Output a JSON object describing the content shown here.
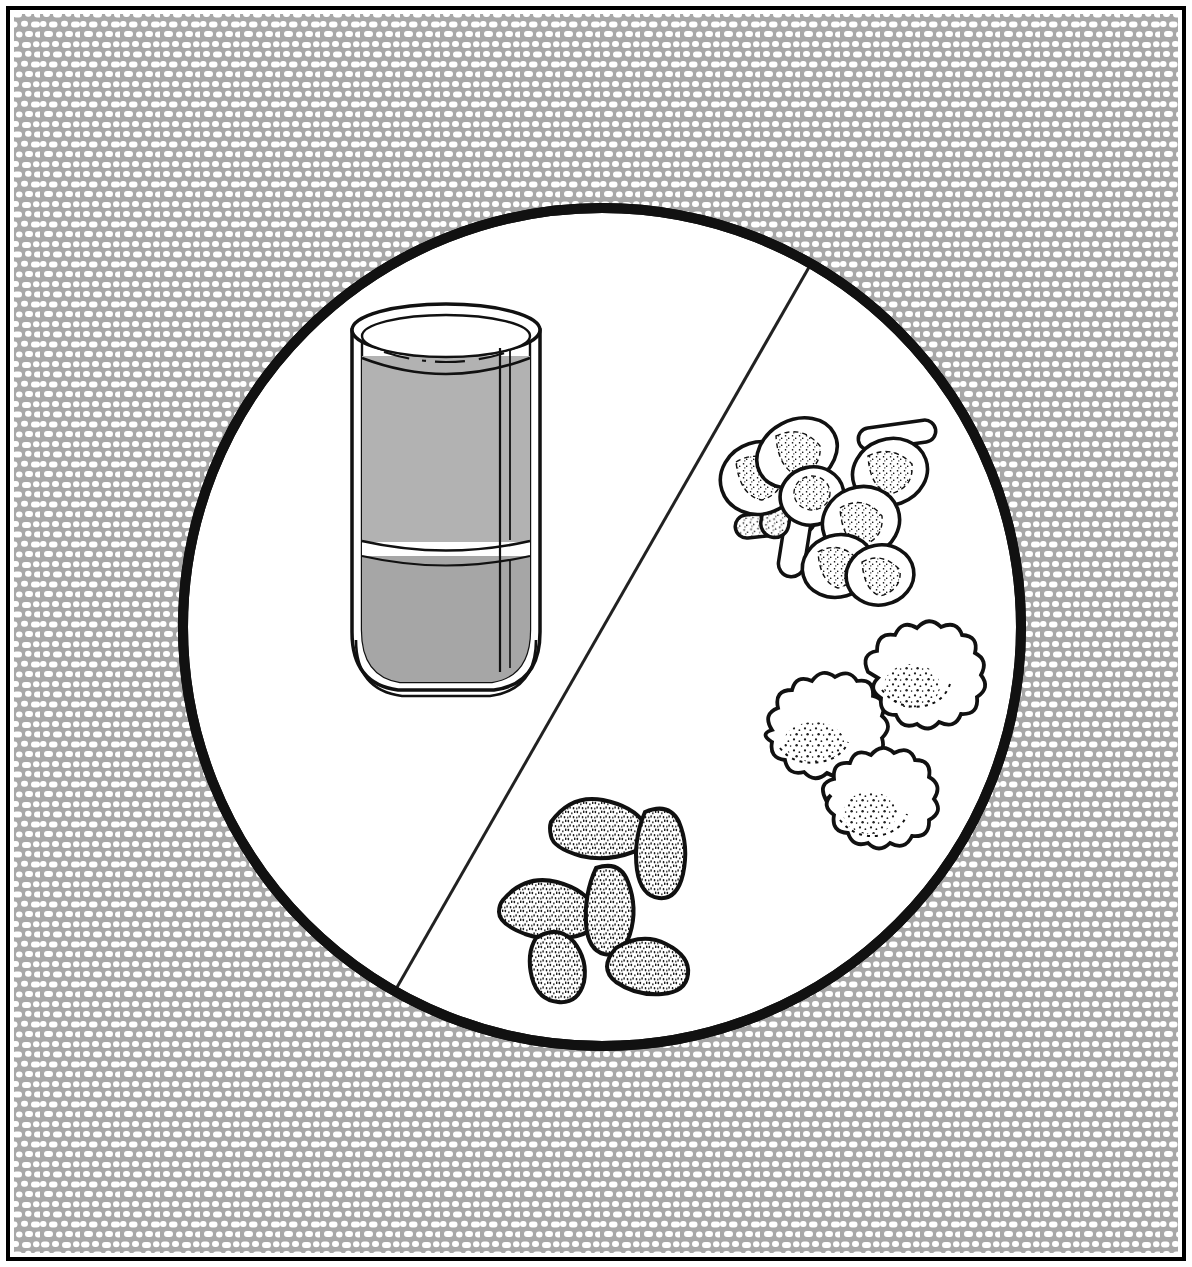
{
  "figure": {
    "kind": "scientific-line-illustration",
    "canvas": {
      "width": 1192,
      "height": 1267
    },
    "colors": {
      "page_background": "#ffffff",
      "frame_stroke": "#000000",
      "texture_background": "#a8a8a8",
      "texture_dots": "#ffffff",
      "circle_field": "#ffffff",
      "circle_stroke": "#111111",
      "divider_stroke": "#222222",
      "ink": "#000000",
      "liquid_upper_fill": "#b2b2b2",
      "liquid_lower_fill": "#a6a6a6",
      "glass_highlight": "#ffffff",
      "stipple_ink": "#1a1a1a"
    },
    "frame": {
      "label": "outer rule border",
      "x": 8,
      "y": 8,
      "width": 1176,
      "height": 1251,
      "stroke_width": 4
    },
    "texture_field": {
      "label": "stippled halftone background",
      "description": "rows of small white rounded dots over mid-gray ground",
      "x": 14,
      "y": 14,
      "width": 1164,
      "height": 1239,
      "dot_rows": 62,
      "dot_columns": 58
    },
    "specimen_circle": {
      "label": "microscope field of view",
      "center_x": 602,
      "center_y": 627,
      "radius": 424,
      "stroke_width": 10,
      "fill": "#ffffff"
    },
    "divider_line": {
      "label": "diagonal field divider",
      "x1": 812,
      "y1": 262,
      "x2": 392,
      "y2": 996,
      "stroke_width": 3
    },
    "beaker": {
      "label": "graduated glass beaker with two settled liquid layers",
      "left": 352,
      "top": 310,
      "width": 188,
      "height": 382,
      "rim_label": "double-lined elliptical rim",
      "layers": [
        {
          "name": "upper liquid layer",
          "top_y": 356,
          "bottom_y": 542,
          "fill": "#b2b2b2"
        },
        {
          "name": "lower sediment layer",
          "top_y": 556,
          "bottom_y": 682,
          "fill": "#a6a6a6"
        }
      ],
      "separation_band": {
        "name": "clear boundary band",
        "top_y": 542,
        "bottom_y": 556
      },
      "highlight": {
        "name": "vertical glass highlight",
        "x": 500,
        "top_y": 348,
        "bottom_y": 672
      }
    },
    "specimen_groups": [
      {
        "id": "erythrocytes-and-bacilli",
        "label": "Biconcave disc cells with rod bacteria",
        "region": "upper right quadrant",
        "disc_count": 6,
        "rod_count": 4,
        "description": "Round to oval biconcave cells drawn with outline and stippled crescent interiors, interspersed with capsule shaped rods"
      },
      {
        "id": "crenated-star-cells",
        "label": "Irregular crenated cells",
        "region": "middle right",
        "cell_count": 3,
        "description": "Scalloped wavy-margined cells with a speckled granular nucleus region"
      },
      {
        "id": "stippled-bean-cells",
        "label": "Kidney bean shaped stippled cells",
        "region": "lower middle",
        "cell_count": 6,
        "description": "Bean and oval bodies densely filled with fine stipple shading and heavy outlines"
      }
    ]
  }
}
